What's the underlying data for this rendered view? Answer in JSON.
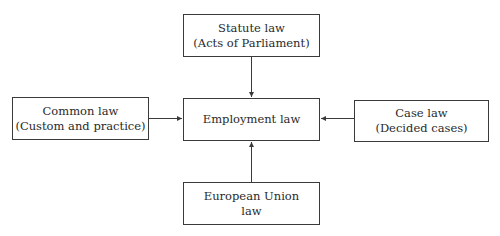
{
  "diagram": {
    "center": {
      "lines": [
        "Employment law"
      ]
    },
    "top": {
      "lines": [
        "Statute law",
        "(Acts of Parliament)"
      ]
    },
    "left": {
      "lines": [
        "Common law",
        "(Custom and practice)"
      ]
    },
    "right": {
      "lines": [
        "Case law",
        "(Decided cases)"
      ]
    },
    "bottom": {
      "lines": [
        "European Union",
        "law"
      ]
    },
    "edges": [
      {
        "from": "top",
        "to": "center"
      },
      {
        "from": "left",
        "to": "center"
      },
      {
        "from": "right",
        "to": "center"
      },
      {
        "from": "bottom",
        "to": "center"
      }
    ],
    "colors": {
      "line": "#3a3a3a",
      "text": "#2a2a2a",
      "background": "#ffffff"
    }
  }
}
